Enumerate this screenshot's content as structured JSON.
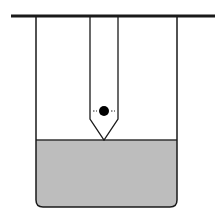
{
  "diagram": {
    "colors": {
      "line": "#1a1a1a",
      "liquid": "#bdbdbd",
      "ball": "#000000",
      "background": "#ffffff"
    },
    "support_bar": {
      "x1": 11,
      "x2": 215,
      "y": 16,
      "thickness": 3
    },
    "beaker": {
      "left": 36,
      "right": 177,
      "top": 16,
      "bottom": 207,
      "corner_radius": 7
    },
    "liquid": {
      "top": 140
    },
    "tube": {
      "left": 90,
      "right": 118,
      "top": 16,
      "cone_start": 119,
      "tip_x": 104,
      "tip_y": 140
    },
    "ball": {
      "cx": 104,
      "cy": 111,
      "r": 5
    },
    "dashes": [
      {
        "x1": 93,
        "x2": 97,
        "y": 111
      },
      {
        "x1": 111,
        "x2": 115,
        "y": 111
      }
    ]
  }
}
